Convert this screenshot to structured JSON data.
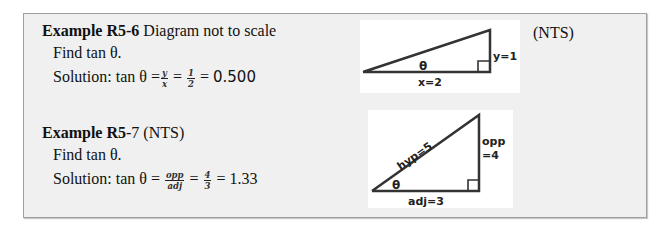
{
  "examples": [
    {
      "title_bold": "Example R5-6",
      "title_rest": " Diagram not to scale",
      "prompt": "Find tan θ.",
      "solution_prefix": "Solution: tan θ =",
      "fraction1": {
        "num": "y",
        "den": "x"
      },
      "eq1": "=",
      "fraction2": {
        "num": "1",
        "den": "2"
      },
      "eq2": "=",
      "result": "0.500",
      "diagram": {
        "angle_label": "θ",
        "base_label": "x=2",
        "height_label": "y=1"
      },
      "side_note": "(NTS)"
    },
    {
      "title_bold": "Example R5",
      "title_rest": "-7 (NTS)",
      "prompt": "Find tan θ.",
      "solution_prefix": "Solution: tan θ =",
      "fraction1": {
        "num": "opp",
        "den": "adj"
      },
      "eq1": "=",
      "fraction2": {
        "num": "4",
        "den": "3"
      },
      "eq2": "=",
      "result": "1.33",
      "diagram": {
        "angle_label": "θ",
        "base_label": "adj=3",
        "height_label_line1": "opp",
        "height_label_line2": "=4",
        "hyp_label": "hyp=5"
      }
    }
  ]
}
